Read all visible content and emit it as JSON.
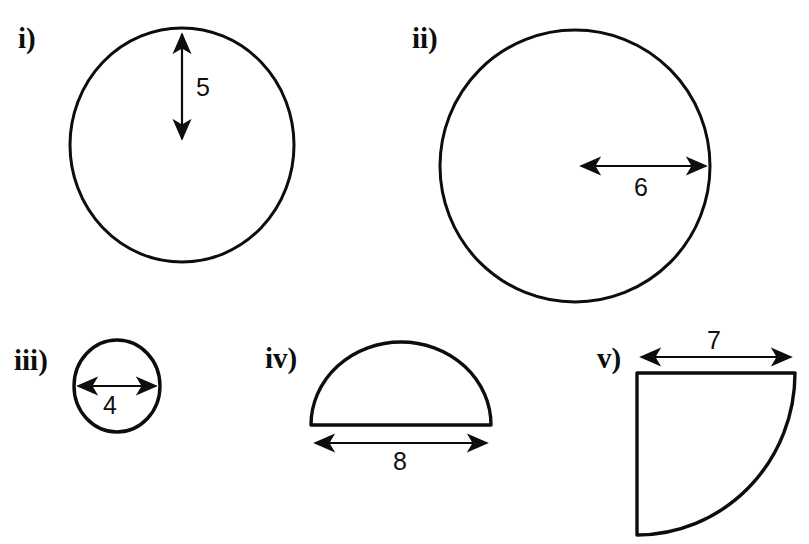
{
  "figure": {
    "background_color": "#ffffff",
    "stroke_color": "#0d0d0d",
    "title_text": "",
    "shapes": [
      {
        "id": "i",
        "label": "i)",
        "shape_type": "circle",
        "dimension_kind": "radius",
        "dimension_value": "5",
        "dimension_orientation": "vertical",
        "label_x": 18,
        "label_y": 48,
        "value_x": 196,
        "value_y": 96
      },
      {
        "id": "ii",
        "label": "ii)",
        "shape_type": "circle",
        "dimension_kind": "radius",
        "dimension_value": "6",
        "dimension_orientation": "horizontal",
        "label_x": 412,
        "label_y": 48,
        "value_x": 641,
        "value_y": 196
      },
      {
        "id": "iii",
        "label": "iii)",
        "shape_type": "circle",
        "dimension_kind": "diameter",
        "dimension_value": "4",
        "dimension_orientation": "horizontal",
        "label_x": 14,
        "label_y": 370,
        "value_x": 110,
        "value_y": 414
      },
      {
        "id": "iv",
        "label": "iv)",
        "shape_type": "semicircle",
        "dimension_kind": "diameter",
        "dimension_value": "8",
        "dimension_orientation": "horizontal",
        "label_x": 265,
        "label_y": 368,
        "value_x": 400,
        "value_y": 470
      },
      {
        "id": "v",
        "label": "v)",
        "shape_type": "quarter-circle",
        "dimension_kind": "radius",
        "dimension_value": "7",
        "dimension_orientation": "horizontal",
        "label_x": 597,
        "label_y": 368,
        "value_x": 714,
        "value_y": 349
      }
    ]
  }
}
